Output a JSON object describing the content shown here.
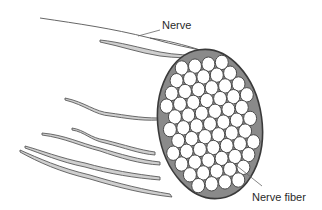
{
  "figure": {
    "labels": {
      "nerve": "Nerve",
      "nerve_fiber": "Nerve fiber"
    },
    "colors": {
      "background": "#ffffff",
      "outline": "#3a3a3a",
      "strand_fill": "#cfcfcf",
      "interstitial": "#8a8a8a",
      "fiber_fill": "#ffffff",
      "label_text": "#2a2a2a"
    }
  }
}
